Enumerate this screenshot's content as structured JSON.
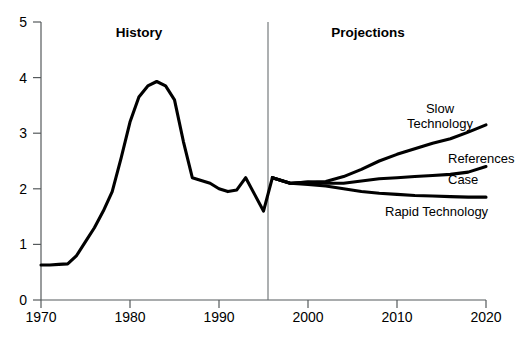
{
  "chart_data": {
    "type": "line",
    "title": "",
    "xlabel": "",
    "ylabel": "",
    "xlim": [
      1970,
      2020
    ],
    "ylim": [
      0,
      5
    ],
    "grid": false,
    "legend_position": "inline-right",
    "x_ticks": [
      "1970",
      "1980",
      "1990",
      "2000",
      "2010",
      "2020"
    ],
    "y_ticks": [
      "0",
      "1",
      "2",
      "3",
      "4",
      "5"
    ],
    "annotations": [
      {
        "text": "History",
        "x": 1983,
        "y": 4.78,
        "style": "bold"
      },
      {
        "text": "Projections",
        "x": 2008,
        "y": 4.78,
        "style": "bold"
      }
    ],
    "divider": {
      "x": 1996,
      "label": "history-projection-divider"
    },
    "series": [
      {
        "name": "History",
        "label": "",
        "x": [
          1970,
          1971,
          1972,
          1973,
          1974,
          1975,
          1976,
          1977,
          1978,
          1979,
          1980,
          1981,
          1982,
          1983,
          1984,
          1985,
          1986,
          1987,
          1988,
          1989,
          1990,
          1991,
          1992,
          1993,
          1994,
          1995,
          1996
        ],
        "values": [
          0.63,
          0.63,
          0.64,
          0.65,
          0.8,
          1.05,
          1.3,
          1.6,
          1.95,
          2.55,
          3.2,
          3.65,
          3.85,
          3.93,
          3.85,
          3.6,
          2.85,
          2.2,
          2.15,
          2.1,
          2.0,
          1.95,
          1.98,
          2.2,
          1.9,
          1.6,
          2.2
        ]
      },
      {
        "name": "Slow Technology",
        "label": "Slow\nTechnology",
        "x": [
          1996,
          1998,
          2000,
          2002,
          2004,
          2006,
          2008,
          2010,
          2012,
          2014,
          2016,
          2018,
          2020
        ],
        "values": [
          2.2,
          2.1,
          2.12,
          2.13,
          2.22,
          2.35,
          2.5,
          2.62,
          2.72,
          2.82,
          2.9,
          3.02,
          3.15
        ]
      },
      {
        "name": "Reference Case",
        "label": "References\nCase",
        "x": [
          1996,
          1998,
          2000,
          2002,
          2004,
          2006,
          2008,
          2010,
          2012,
          2014,
          2016,
          2018,
          2020
        ],
        "values": [
          2.2,
          2.1,
          2.12,
          2.1,
          2.1,
          2.14,
          2.18,
          2.2,
          2.22,
          2.24,
          2.26,
          2.3,
          2.4
        ]
      },
      {
        "name": "Rapid Technology",
        "label": "Rapid Technology",
        "x": [
          1996,
          1998,
          2000,
          2002,
          2004,
          2006,
          2008,
          2010,
          2012,
          2014,
          2016,
          2018,
          2020
        ],
        "values": [
          2.2,
          2.1,
          2.08,
          2.05,
          2.0,
          1.95,
          1.92,
          1.9,
          1.88,
          1.87,
          1.86,
          1.85,
          1.85
        ]
      }
    ],
    "series_labels": {
      "slow_technology_line1": "Slow",
      "slow_technology_line2": "Technology",
      "reference_case_line1": "References",
      "reference_case_line2": "Case",
      "rapid_technology": "Rapid Technology"
    },
    "colors": {
      "line": "#000000",
      "axis": "#555a5c",
      "divider": "#6a6f71",
      "background": "#ffffff"
    }
  },
  "source_note": ""
}
